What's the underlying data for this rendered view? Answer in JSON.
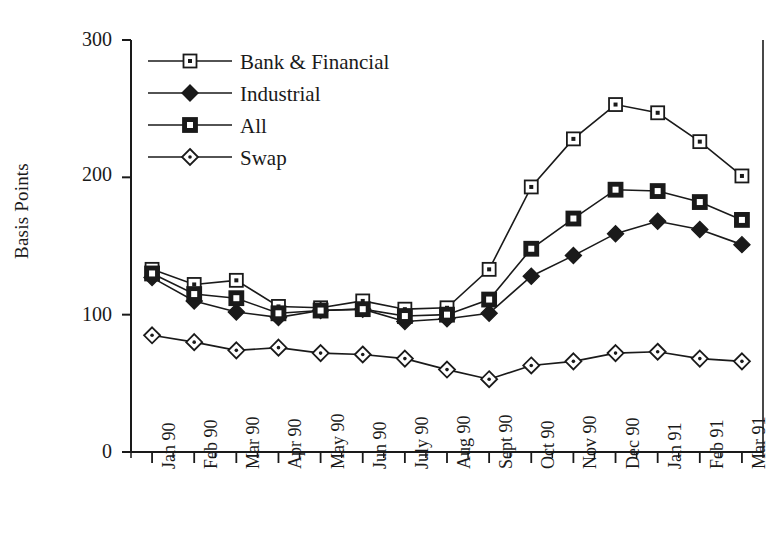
{
  "chart_data": {
    "type": "line",
    "title": "",
    "xlabel": "",
    "ylabel": "Basis Points",
    "ylim": [
      0,
      300
    ],
    "yticks": [
      0,
      100,
      200,
      300
    ],
    "grid": false,
    "legend_position": "top-left-inside",
    "categories": [
      "Jan 90",
      "Feb 90",
      "Mar 90",
      "Apr 90",
      "May 90",
      "Jun 90",
      "July 90",
      "Aug 90",
      "Sept 90",
      "Oct 90",
      "Nov 90",
      "Dec 90",
      "Jan 91",
      "Feb 91",
      "Mar 91"
    ],
    "series": [
      {
        "name": "Bank & Financial",
        "marker": "open-square",
        "values": [
          133,
          122,
          125,
          106,
          105,
          110,
          104,
          105,
          133,
          193,
          228,
          253,
          247,
          226,
          201
        ]
      },
      {
        "name": "Industrial",
        "marker": "filled-diamond",
        "values": [
          127,
          110,
          102,
          98,
          103,
          104,
          95,
          97,
          101,
          128,
          143,
          159,
          168,
          162,
          151
        ]
      },
      {
        "name": "All",
        "marker": "filled-square",
        "values": [
          130,
          115,
          112,
          101,
          103,
          104,
          99,
          100,
          111,
          148,
          170,
          191,
          190,
          182,
          169
        ]
      },
      {
        "name": "Swap",
        "marker": "open-diamond",
        "values": [
          85,
          80,
          74,
          76,
          72,
          71,
          68,
          60,
          53,
          63,
          66,
          72,
          73,
          68,
          66
        ]
      }
    ]
  },
  "axis": {
    "y_tick_labels": [
      "300",
      "200",
      "100",
      "0"
    ],
    "y_label_text": "Basis Points"
  },
  "legend": {
    "entries": [
      {
        "label": "Bank & Financial"
      },
      {
        "label": "Industrial"
      },
      {
        "label": "All"
      },
      {
        "label": "Swap"
      }
    ]
  },
  "colors": {
    "ink": "#1a1a1a",
    "background": "#ffffff"
  }
}
